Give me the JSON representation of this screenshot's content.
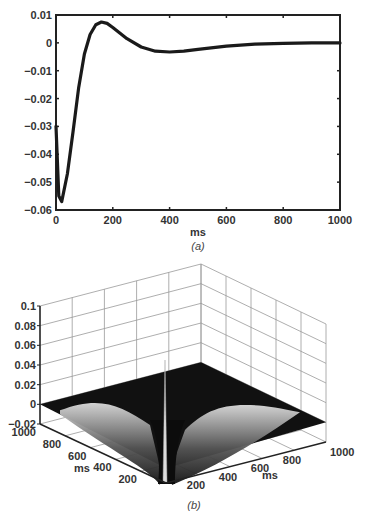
{
  "chart_data": [
    {
      "panel": "a",
      "type": "line",
      "caption": "(a)",
      "xlabel": "ms",
      "ylabel": "",
      "xlim": [
        0,
        1000
      ],
      "ylim": [
        -0.06,
        0.01
      ],
      "xticks": [
        "0",
        "200",
        "400",
        "600",
        "800",
        "1000"
      ],
      "yticks": [
        "0.01",
        "0",
        "−0.01",
        "−0.02",
        "−0.03",
        "−0.04",
        "−0.05",
        "−0.06"
      ],
      "grid": false,
      "series": [
        {
          "name": "kernel",
          "x": [
            0,
            10,
            20,
            40,
            60,
            80,
            100,
            120,
            140,
            160,
            180,
            200,
            250,
            300,
            350,
            400,
            450,
            500,
            600,
            700,
            800,
            900,
            1000
          ],
          "y": [
            -0.03,
            -0.055,
            -0.057,
            -0.047,
            -0.032,
            -0.016,
            -0.004,
            0.003,
            0.0065,
            0.0075,
            0.007,
            0.0055,
            0.0015,
            -0.0015,
            -0.003,
            -0.0033,
            -0.003,
            -0.0023,
            -0.0012,
            -0.0005,
            -0.0002,
            0.0,
            0.0
          ]
        }
      ]
    },
    {
      "panel": "b",
      "type": "surface",
      "caption": "(b)",
      "xlabel": "ms",
      "ylabel": "ms",
      "zlim": [
        -0.02,
        0.1
      ],
      "xticks": [
        "200",
        "400",
        "600",
        "800",
        "1000"
      ],
      "yticks": [
        "200",
        "400",
        "600",
        "800",
        "1000"
      ],
      "zticks": [
        "0.1",
        "0.08",
        "0.06",
        "0.04",
        "0.02",
        "0",
        "−0.02"
      ],
      "grid": true,
      "description": "Symmetric 2D kernel surface: sharp positive spike along the diagonal near origin (~0.1), negative troughs adjacent, flat near 0 elsewhere"
    }
  ]
}
